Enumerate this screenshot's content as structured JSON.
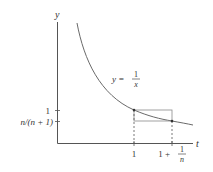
{
  "figure": {
    "axes": {
      "x_label": "t",
      "y_label": "y"
    },
    "curve_label": {
      "lhs": "y =",
      "numerator": "1",
      "denominator": "x"
    },
    "y_ticks": [
      {
        "label": "1"
      },
      {
        "label": "n/(n + 1)"
      }
    ],
    "x_ticks": [
      {
        "label": "1"
      },
      {
        "label_prefix": "1 +",
        "frac_num": "1",
        "frac_den": "n"
      }
    ],
    "colors": {
      "axis": "#555555",
      "curve": "#6a6a6a",
      "rectangle": "#8a8a8a",
      "text": "#333333"
    }
  }
}
